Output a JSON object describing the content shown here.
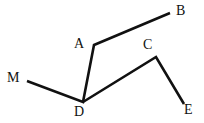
{
  "figure": {
    "kind": "line-diagram",
    "canvas": {
      "width": 204,
      "height": 123,
      "background": "#ffffff"
    },
    "stroke": {
      "color": "#111111",
      "width": 2.6,
      "linejoin": "miter",
      "linecap": "butt"
    },
    "points": {
      "M": {
        "x": 27,
        "y": 81
      },
      "D": {
        "x": 83,
        "y": 102
      },
      "A": {
        "x": 94,
        "y": 45
      },
      "B": {
        "x": 170,
        "y": 13
      },
      "C": {
        "x": 156,
        "y": 57
      },
      "E": {
        "x": 184,
        "y": 104
      }
    },
    "paths": [
      {
        "id": "path-m-d-a-b",
        "name": "polyline-m-d-a-b",
        "vertices": [
          "M",
          "D",
          "A",
          "B"
        ]
      },
      {
        "id": "path-d-c-e",
        "name": "polyline-d-c-e",
        "vertices": [
          "D",
          "C",
          "E"
        ]
      }
    ],
    "labels": [
      {
        "id": "label-a",
        "text": "A",
        "x": 74,
        "y": 37,
        "anchor": "start"
      },
      {
        "id": "label-b",
        "text": "B",
        "x": 176,
        "y": 4,
        "anchor": "start"
      },
      {
        "id": "label-c",
        "text": "C",
        "x": 143,
        "y": 38,
        "anchor": "start"
      },
      {
        "id": "label-d",
        "text": "D",
        "x": 74,
        "y": 105,
        "anchor": "start"
      },
      {
        "id": "label-e",
        "text": "E",
        "x": 184,
        "y": 103,
        "anchor": "start"
      },
      {
        "id": "label-m",
        "text": "M",
        "x": 7,
        "y": 71,
        "anchor": "start"
      }
    ]
  }
}
